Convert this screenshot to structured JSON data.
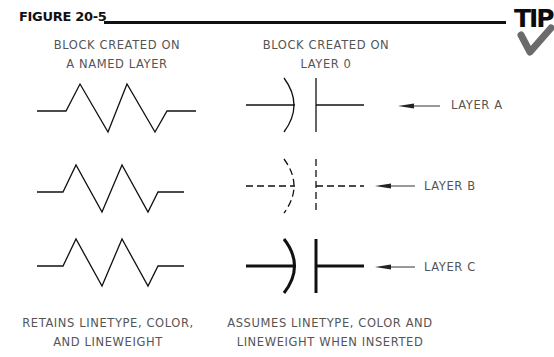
{
  "figure": {
    "title": "FIGURE 20-5",
    "tip_label": "TIP"
  },
  "columns": {
    "left_header": [
      "BLOCK CREATED ON",
      "A NAMED LAYER"
    ],
    "middle_header": [
      "BLOCK CREATED ON",
      "LAYER 0"
    ],
    "left_footer": [
      "RETAINS LINETYPE, COLOR,",
      "AND LINEWEIGHT"
    ],
    "middle_footer": [
      "ASSUMES LINETYPE, COLOR AND",
      "LINEWEIGHT WHEN INSERTED"
    ]
  },
  "rows": [
    {
      "layer_label": "LAYER A",
      "capacitor_style": "continuous"
    },
    {
      "layer_label": "LAYER B",
      "capacitor_style": "dashed"
    },
    {
      "layer_label": "LAYER C",
      "capacitor_style": "heavy"
    }
  ],
  "colors": {
    "line": "#111111",
    "text": "#555555",
    "tip_check": "#6b6b6b"
  }
}
